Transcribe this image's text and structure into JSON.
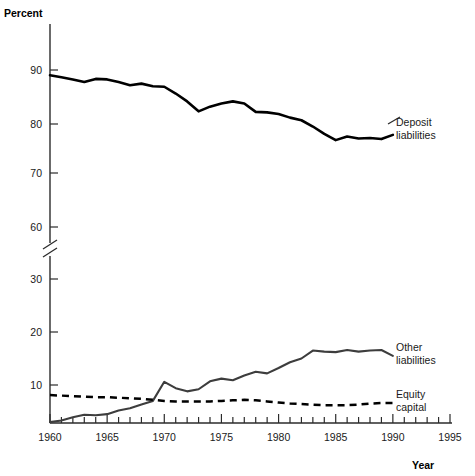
{
  "chart_data": {
    "type": "line",
    "title": "",
    "xlabel": "Year",
    "ylabel": "Percent",
    "ylabel_position": "top-left",
    "xlabel_position": "bottom-right",
    "grid": false,
    "legend": "inline-right-labels",
    "xlim": [
      1960,
      1995
    ],
    "xticks_major": [
      1960,
      1965,
      1970,
      1975,
      1980,
      1985,
      1990,
      1995
    ],
    "xticks_minor_step": 1,
    "y_axis_broken": true,
    "y_break_between": [
      30,
      60
    ],
    "ylim_upper": [
      60,
      92
    ],
    "ylim_lower": [
      0,
      30
    ],
    "yticks": [
      90,
      80,
      70,
      60,
      30,
      20,
      10
    ],
    "x": [
      1960,
      1961,
      1962,
      1963,
      1964,
      1965,
      1966,
      1967,
      1968,
      1969,
      1970,
      1971,
      1972,
      1973,
      1974,
      1975,
      1976,
      1977,
      1978,
      1979,
      1980,
      1981,
      1982,
      1983,
      1984,
      1985,
      1986,
      1987,
      1988,
      1989,
      1990
    ],
    "series": [
      {
        "name": "Deposit liabilities",
        "label_line1": "Deposit",
        "label_line2": "liabilities",
        "style": "solid",
        "color": "#000000",
        "values": [
          89.0,
          88.6,
          88.2,
          87.7,
          88.3,
          88.2,
          87.7,
          87.1,
          87.4,
          86.9,
          86.8,
          85.5,
          84.0,
          82.1,
          83.0,
          83.6,
          84.0,
          83.6,
          82.0,
          81.9,
          81.6,
          80.9,
          80.4,
          79.2,
          77.8,
          76.6,
          77.3,
          76.9,
          77.0,
          76.8,
          77.6
        ]
      },
      {
        "name": "Other liabilities",
        "label_line1": "Other",
        "label_line2": "liabilities",
        "style": "solid",
        "color": "#3d3d3d",
        "values": [
          3.0,
          3.3,
          3.9,
          4.4,
          4.3,
          4.5,
          5.2,
          5.6,
          6.3,
          7.0,
          10.6,
          9.4,
          8.8,
          9.2,
          10.7,
          11.2,
          10.9,
          11.8,
          12.5,
          12.2,
          13.2,
          14.3,
          15.0,
          16.5,
          16.3,
          16.2,
          16.6,
          16.3,
          16.5,
          16.6,
          15.5
        ]
      },
      {
        "name": "Equity capital",
        "label_line1": "Equity",
        "label_line2": "capital",
        "style": "dashed",
        "color": "#000000",
        "values": [
          8.1,
          8.0,
          7.9,
          7.8,
          7.7,
          7.7,
          7.6,
          7.5,
          7.4,
          7.2,
          7.0,
          6.9,
          6.9,
          6.9,
          6.9,
          7.0,
          7.1,
          7.2,
          7.1,
          6.9,
          6.7,
          6.5,
          6.4,
          6.3,
          6.2,
          6.2,
          6.2,
          6.3,
          6.5,
          6.6,
          6.6
        ]
      }
    ]
  },
  "axis": {
    "y_title": "Percent",
    "x_title": "Year",
    "ytick_labels": [
      "90",
      "80",
      "70",
      "60",
      "30",
      "20",
      "10"
    ],
    "xtick_labels": [
      "1960",
      "1965",
      "1970",
      "1975",
      "1980",
      "1985",
      "1990",
      "1995"
    ]
  }
}
